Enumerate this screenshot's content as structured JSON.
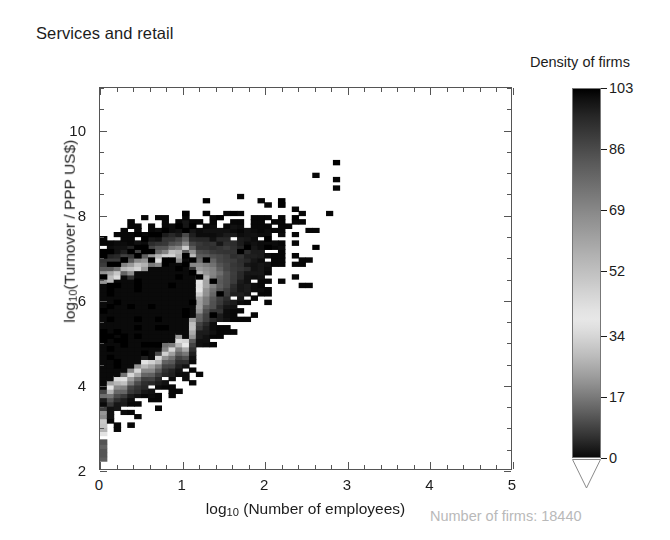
{
  "figure": {
    "title": "Services and retail",
    "background": "#ffffff"
  },
  "annotation": {
    "firm_count_text": "Number of firms: 18440",
    "color": "#b9b9b9"
  },
  "axes": {
    "x": {
      "title_prefix": "log",
      "title_sub": "10",
      "title_suffix": " (Number of employees)",
      "ticks": [
        "0",
        "1",
        "2",
        "3",
        "4",
        "5"
      ],
      "range": [
        0,
        5
      ],
      "minor_per_major": 5
    },
    "y": {
      "title_prefix": "log",
      "title_sub": "10",
      "title_suffix": "(Turnover / PPP US$)",
      "ticks": [
        "2",
        "4",
        "6",
        "8",
        "10"
      ],
      "range": [
        2,
        11
      ],
      "minor_per_major": 4
    }
  },
  "colorbar": {
    "title": "Density of firms",
    "ticks": [
      "103",
      "86",
      "69",
      "52",
      "34",
      "17",
      "0"
    ],
    "vmin": 0,
    "vmax": 103,
    "under_arrow": true,
    "orientation": "vertical",
    "colormap": "inverted-gray-peaked"
  },
  "chart_data": {
    "type": "heatmap",
    "title": "Services and retail",
    "xlabel": "log10 (Number of employees)",
    "ylabel": "log10(Turnover / PPP US$)",
    "xlim": [
      0,
      5
    ],
    "ylim": [
      2,
      11
    ],
    "grid": false,
    "legend": "colorbar-right",
    "zlabel": "Density of firms",
    "zlim": [
      0,
      103
    ],
    "bin_size_x": 0.0833,
    "bin_size_y": 0.1,
    "n_observations": 18440,
    "structure": {
      "ridge_slope": 0.95,
      "ridge_intercept": 5.2,
      "ridge_scatter_sigma": 0.62,
      "peak_density_location": [
        0.85,
        5.6
      ],
      "peak_density_value": 103,
      "discrete_columns_x": [
        0.0,
        0.301,
        0.477,
        0.602,
        0.699,
        0.778,
        0.845,
        0.903,
        0.954,
        1.0
      ],
      "discrete_column_weights": [
        1.0,
        0.5,
        0.34,
        0.55,
        0.3,
        0.26,
        0.24,
        0.2,
        0.18,
        0.62
      ],
      "x0_stripe": {
        "y_min": 2.1,
        "y_max": 6.1,
        "y_core_min": 2.8,
        "y_core_max": 5.95
      }
    },
    "sampled_bins": [
      {
        "x": 0.0,
        "y": 4.4,
        "count": 96
      },
      {
        "x": 0.0,
        "y": 5.0,
        "count": 88
      },
      {
        "x": 0.0,
        "y": 3.6,
        "count": 72
      },
      {
        "x": 0.3,
        "y": 5.2,
        "count": 64
      },
      {
        "x": 0.6,
        "y": 5.4,
        "count": 78
      },
      {
        "x": 0.85,
        "y": 5.6,
        "count": 103
      },
      {
        "x": 0.9,
        "y": 5.9,
        "count": 95
      },
      {
        "x": 1.0,
        "y": 5.8,
        "count": 70
      },
      {
        "x": 1.2,
        "y": 6.0,
        "count": 45
      },
      {
        "x": 1.5,
        "y": 6.3,
        "count": 28
      },
      {
        "x": 2.0,
        "y": 6.9,
        "count": 12
      },
      {
        "x": 2.5,
        "y": 7.4,
        "count": 6
      },
      {
        "x": 3.0,
        "y": 7.9,
        "count": 3
      },
      {
        "x": 3.5,
        "y": 8.3,
        "count": 2
      },
      {
        "x": 4.0,
        "y": 8.7,
        "count": 1
      }
    ]
  }
}
